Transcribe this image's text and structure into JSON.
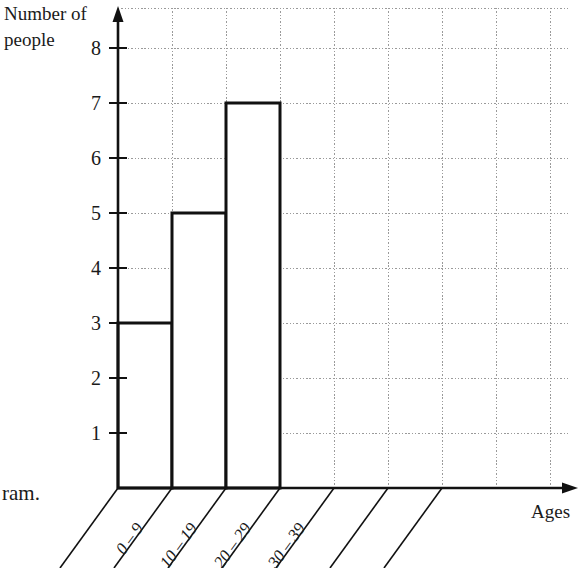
{
  "chart_data": {
    "type": "bar",
    "title": "",
    "xlabel": "Ages",
    "ylabel": "Number of people",
    "categories": [
      "0 – 9",
      "10 – 19",
      "20 – 29",
      "30 – 39"
    ],
    "values": [
      3,
      5,
      7,
      0
    ],
    "ylim": [
      0,
      8
    ],
    "ytick_labels": [
      "1",
      "2",
      "3",
      "4",
      "5",
      "6",
      "7",
      "8"
    ],
    "ytick_values": [
      1,
      2,
      3,
      4,
      5,
      6,
      7,
      8
    ],
    "grid": true,
    "legend": "none",
    "bar_fill": "#ffffff",
    "bar_stroke": "#111111",
    "grid_color": "#9a9a9a",
    "axis_color": "#111111"
  },
  "labels": {
    "y_axis_line1": "Number of",
    "y_axis_line2": "people",
    "x_axis": "Ages",
    "side_note": "ram."
  },
  "ticks": {
    "y": [
      "8",
      "7",
      "6",
      "5",
      "4",
      "3",
      "2",
      "1"
    ]
  },
  "categories": [
    {
      "label": "0 – 9",
      "value": 3
    },
    {
      "label": "10 – 19",
      "value": 5
    },
    {
      "label": "20 – 29",
      "value": 7
    },
    {
      "label": "30 – 39",
      "value": 0
    }
  ]
}
